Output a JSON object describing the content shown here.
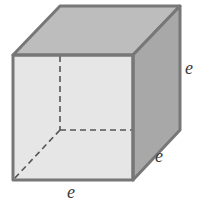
{
  "figure": {
    "type": "cube",
    "labels": {
      "vertical_edge": "e",
      "depth_edge": "e",
      "bottom_edge": "e"
    },
    "colors": {
      "background": "#ffffff",
      "front_face": "#e6e6e6",
      "top_face": "#bdbdbd",
      "right_face": "#a8a8a8",
      "edge": "#777777",
      "hidden_edge": "#555555",
      "label": "#3a3a3a"
    }
  }
}
